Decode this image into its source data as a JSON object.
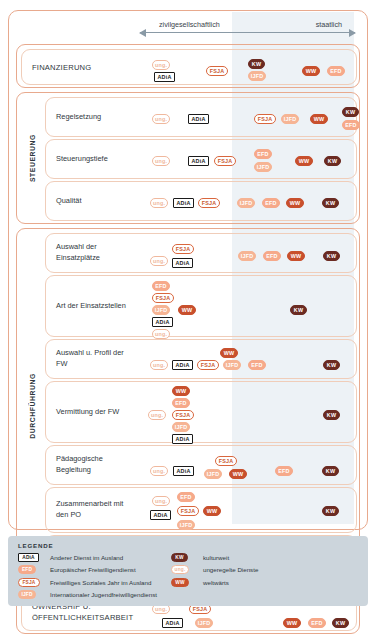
{
  "axis": {
    "left_label": "zivilgesellschaftlich",
    "right_label": "staatlich"
  },
  "sections": [
    {
      "id": "finanzierung",
      "group_label": "",
      "rows": [
        {
          "label": "FINANZIERUNG",
          "plain": true,
          "badges": [
            {
              "type": "ung",
              "text": "ung.",
              "x": 150,
              "y": 10
            },
            {
              "type": "adia",
              "text": "ADiA",
              "x": 152,
              "y": 22
            },
            {
              "type": "fsja",
              "text": "FSJA",
              "x": 204,
              "y": 16
            },
            {
              "type": "kw",
              "text": "KW",
              "x": 246,
              "y": 9
            },
            {
              "type": "ijfd",
              "text": "IJFD",
              "x": 246,
              "y": 21
            },
            {
              "type": "ww",
              "text": "WW",
              "x": 300,
              "y": 16
            },
            {
              "type": "efd",
              "text": "EFD",
              "x": 325,
              "y": 16
            }
          ]
        }
      ]
    },
    {
      "id": "steuerung",
      "group_label": "STEUERUNG",
      "rows": [
        {
          "label": "Regelsetzung",
          "badges": [
            {
              "type": "ung",
              "text": "ung.",
              "x": 150,
              "y": 16
            },
            {
              "type": "adia",
              "text": "ADiA",
              "x": 186,
              "y": 16
            },
            {
              "type": "fsja",
              "text": "FSJA",
              "x": 252,
              "y": 16
            },
            {
              "type": "ijfd",
              "text": "IJFD",
              "x": 279,
              "y": 16
            },
            {
              "type": "ww",
              "text": "WW",
              "x": 308,
              "y": 16
            },
            {
              "type": "kw",
              "text": "KW",
              "x": 340,
              "y": 9
            },
            {
              "type": "efd",
              "text": "EFD",
              "x": 340,
              "y": 22
            }
          ]
        },
        {
          "label": "Steuerungstiefe",
          "badges": [
            {
              "type": "ung",
              "text": "ung.",
              "x": 150,
              "y": 16
            },
            {
              "type": "adia",
              "text": "ADiA",
              "x": 186,
              "y": 16
            },
            {
              "type": "fsja",
              "text": "FSJA",
              "x": 212,
              "y": 16
            },
            {
              "type": "efd",
              "text": "EFD",
              "x": 252,
              "y": 9
            },
            {
              "type": "ijfd",
              "text": "IJFD",
              "x": 252,
              "y": 22
            },
            {
              "type": "ww",
              "text": "WW",
              "x": 293,
              "y": 16
            },
            {
              "type": "kw",
              "text": "KW",
              "x": 322,
              "y": 16
            }
          ]
        },
        {
          "label": "Qualität",
          "badges": [
            {
              "type": "ung",
              "text": "ung.",
              "x": 148,
              "y": 16
            },
            {
              "type": "adia",
              "text": "ADiA",
              "x": 171,
              "y": 16
            },
            {
              "type": "fsja",
              "text": "FSJA",
              "x": 196,
              "y": 16
            },
            {
              "type": "ijfd",
              "text": "IJFD",
              "x": 235,
              "y": 16
            },
            {
              "type": "efd",
              "text": "EFD",
              "x": 260,
              "y": 16
            },
            {
              "type": "ww",
              "text": "WW",
              "x": 284,
              "y": 16
            },
            {
              "type": "kw",
              "text": "KW",
              "x": 320,
              "y": 16
            }
          ]
        }
      ]
    },
    {
      "id": "durchfuehrung",
      "group_label": "DURCHFÜHRUNG",
      "rows": [
        {
          "label": "Auswahl der Einsatzplätze",
          "badges": [
            {
              "type": "ung",
              "text": "ung.",
              "x": 148,
              "y": 22
            },
            {
              "type": "fsja",
              "text": "FSJA",
              "x": 170,
              "y": 10
            },
            {
              "type": "adia",
              "text": "ADiA",
              "x": 170,
              "y": 24
            },
            {
              "type": "ijfd",
              "text": "IJFD",
              "x": 236,
              "y": 17
            },
            {
              "type": "efd",
              "text": "EFD",
              "x": 261,
              "y": 17
            },
            {
              "type": "ww",
              "text": "WW",
              "x": 285,
              "y": 17
            },
            {
              "type": "kw",
              "text": "KW",
              "x": 321,
              "y": 17
            }
          ]
        },
        {
          "label": "Art der Einsatzstellen",
          "badges": [
            {
              "type": "efd",
              "text": "EFD",
              "x": 150,
              "y": 5
            },
            {
              "type": "fsja",
              "text": "FSJA",
              "x": 150,
              "y": 17
            },
            {
              "type": "ijfd",
              "text": "IJFD",
              "x": 150,
              "y": 29
            },
            {
              "type": "adia",
              "text": "ADiA",
              "x": 150,
              "y": 41
            },
            {
              "type": "ung",
              "text": "ung.",
              "x": 150,
              "y": 53
            },
            {
              "type": "ww",
              "text": "WW",
              "x": 176,
              "y": 29
            },
            {
              "type": "kw",
              "text": "KW",
              "x": 288,
              "y": 29
            }
          ]
        },
        {
          "label": "Auswahl u. Profil der FW",
          "badges": [
            {
              "type": "ung",
              "text": "ung.",
              "x": 148,
              "y": 20
            },
            {
              "type": "ww",
              "text": "WW",
              "x": 218,
              "y": 8
            },
            {
              "type": "adia",
              "text": "ADiA",
              "x": 170,
              "y": 20
            },
            {
              "type": "fsja",
              "text": "FSJA",
              "x": 195,
              "y": 20
            },
            {
              "type": "ijfd",
              "text": "IJFD",
              "x": 221,
              "y": 20
            },
            {
              "type": "efd",
              "text": "EFD",
              "x": 246,
              "y": 20
            },
            {
              "type": "kw",
              "text": "KW",
              "x": 321,
              "y": 20
            }
          ]
        },
        {
          "label": "Vermittlung der FW",
          "badges": [
            {
              "type": "ww",
              "text": "WW",
              "x": 170,
              "y": 4
            },
            {
              "type": "efd",
              "text": "EFD",
              "x": 170,
              "y": 16
            },
            {
              "type": "fsja",
              "text": "FSJA",
              "x": 170,
              "y": 28
            },
            {
              "type": "ijfd",
              "text": "IJFD",
              "x": 170,
              "y": 40
            },
            {
              "type": "adia",
              "text": "ADiA",
              "x": 170,
              "y": 52
            },
            {
              "type": "ung",
              "text": "ung.",
              "x": 146,
              "y": 28
            },
            {
              "type": "kw",
              "text": "KW",
              "x": 321,
              "y": 28
            }
          ]
        },
        {
          "label": "Pädagogische Begleitung",
          "badges": [
            {
              "type": "ung",
              "text": "ung.",
              "x": 148,
              "y": 20
            },
            {
              "type": "adia",
              "text": "ADiA",
              "x": 171,
              "y": 20
            },
            {
              "type": "fsja",
              "text": "FSJA",
              "x": 213,
              "y": 10
            },
            {
              "type": "ijfd",
              "text": "IJFD",
              "x": 202,
              "y": 23
            },
            {
              "type": "ww",
              "text": "WW",
              "x": 227,
              "y": 23
            },
            {
              "type": "efd",
              "text": "EFD",
              "x": 273,
              "y": 20
            },
            {
              "type": "kw",
              "text": "KW",
              "x": 320,
              "y": 20
            }
          ]
        },
        {
          "label": "Zusammenarbeit mit den PO",
          "badges": [
            {
              "type": "ung",
              "text": "ung.",
              "x": 150,
              "y": 8
            },
            {
              "type": "efd",
              "text": "EFD",
              "x": 175,
              "y": 4
            },
            {
              "type": "fsja",
              "text": "FSJA",
              "x": 175,
              "y": 18
            },
            {
              "type": "ww",
              "text": "WW",
              "x": 201,
              "y": 18
            },
            {
              "type": "adia",
              "text": "ADiA",
              "x": 148,
              "y": 22
            },
            {
              "type": "ijfd",
              "text": "IJFD",
              "x": 175,
              "y": 32
            },
            {
              "type": "kw",
              "text": "KW",
              "x": 320,
              "y": 18
            }
          ]
        },
        {
          "label": "Rückkehrarbeit",
          "badges": [
            {
              "type": "ijfd",
              "text": "IJFD",
              "x": 150,
              "y": 6
            },
            {
              "type": "fsja",
              "text": "FSJA",
              "x": 150,
              "y": 19
            },
            {
              "type": "ung",
              "text": "ung.",
              "x": 150,
              "y": 32
            },
            {
              "type": "ww",
              "text": "WW",
              "x": 250,
              "y": 19
            },
            {
              "type": "efd",
              "text": "EFD",
              "x": 300,
              "y": 19
            },
            {
              "type": "kw",
              "text": "KW",
              "x": 325,
              "y": 19
            }
          ]
        }
      ]
    },
    {
      "id": "ownership",
      "group_label": "",
      "rows": [
        {
          "label": "OWNERSHIP U. ÖFFENTLICHKEITSARBEIT",
          "plain": true,
          "badges": [
            {
              "type": "ung",
              "text": "ung.",
              "x": 150,
              "y": 10
            },
            {
              "type": "fsja",
              "text": "FSJA",
              "x": 187,
              "y": 10
            },
            {
              "type": "adia",
              "text": "ADiA",
              "x": 160,
              "y": 24
            },
            {
              "type": "ijfd",
              "text": "IJFD",
              "x": 193,
              "y": 24
            },
            {
              "type": "ww",
              "text": "WW",
              "x": 281,
              "y": 24
            },
            {
              "type": "efd",
              "text": "EFD",
              "x": 306,
              "y": 24
            },
            {
              "type": "kw",
              "text": "KW",
              "x": 330,
              "y": 24
            }
          ]
        }
      ]
    }
  ],
  "legend": {
    "title": "LEGENDE",
    "left_items": [
      {
        "type": "adia",
        "text": "ADiA",
        "label": "Anderer Dienst im Ausland"
      },
      {
        "type": "efd",
        "text": "EFD",
        "label": "Europäischer Freiwilligendienst"
      },
      {
        "type": "fsja",
        "text": "FSJA",
        "label": "Freiwilliges Soziales Jahr im Ausland"
      },
      {
        "type": "ijfd",
        "text": "IJFD",
        "label": "Internationaler Jugendfreiwilligendienst"
      }
    ],
    "right_items": [
      {
        "type": "kw",
        "text": "KW",
        "label": "kulturweit"
      },
      {
        "type": "ung",
        "text": "ung.",
        "label": "ungeregelte Dienste"
      },
      {
        "type": "ww",
        "text": "WW",
        "label": "weltwärts"
      }
    ]
  },
  "colors": {
    "frame": "#e8a98d",
    "state_band": "#dfe8ee",
    "kw": "#6b2b22",
    "ww": "#c8502d",
    "efd": "#f6a98a",
    "ijfd": "#f6b494",
    "fsja": "#d9663d",
    "legend_bg": "#ccd5dc"
  }
}
